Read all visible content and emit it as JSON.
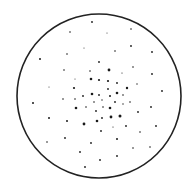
{
  "figure": {
    "width": 186,
    "height": 180,
    "background": "#ffffff",
    "circle": {
      "cx": 99,
      "cy": 96,
      "r": 82,
      "stroke": "#222222",
      "stroke_width": 1.6
    },
    "spot_color": "#1a1a1a",
    "spots": [
      {
        "x": 92,
        "y": 22,
        "r": 0.9
      },
      {
        "x": 70,
        "y": 32,
        "r": 0.8
      },
      {
        "x": 107,
        "y": 33,
        "r": 0.5
      },
      {
        "x": 131,
        "y": 29,
        "r": 0.8
      },
      {
        "x": 40,
        "y": 59,
        "r": 1.0
      },
      {
        "x": 67,
        "y": 54,
        "r": 0.8
      },
      {
        "x": 84,
        "y": 48,
        "r": 0.5
      },
      {
        "x": 115,
        "y": 51,
        "r": 0.8
      },
      {
        "x": 131,
        "y": 46,
        "r": 0.9
      },
      {
        "x": 152,
        "y": 52,
        "r": 0.9
      },
      {
        "x": 99,
        "y": 62,
        "r": 0.9
      },
      {
        "x": 64,
        "y": 70,
        "r": 0.8
      },
      {
        "x": 90,
        "y": 71,
        "r": 0.8
      },
      {
        "x": 109,
        "y": 70,
        "r": 1.4
      },
      {
        "x": 122,
        "y": 73,
        "r": 0.6
      },
      {
        "x": 133,
        "y": 67,
        "r": 0.8
      },
      {
        "x": 152,
        "y": 74,
        "r": 0.9
      },
      {
        "x": 75,
        "y": 79,
        "r": 0.5
      },
      {
        "x": 91,
        "y": 79,
        "r": 1.3
      },
      {
        "x": 99,
        "y": 80,
        "r": 1.1
      },
      {
        "x": 108,
        "y": 81,
        "r": 1.1
      },
      {
        "x": 117,
        "y": 83,
        "r": 0.9
      },
      {
        "x": 74,
        "y": 88,
        "r": 1.1
      },
      {
        "x": 49,
        "y": 87,
        "r": 0.5
      },
      {
        "x": 127,
        "y": 88,
        "r": 1.2
      },
      {
        "x": 137,
        "y": 84,
        "r": 0.7
      },
      {
        "x": 162,
        "y": 91,
        "r": 0.9
      },
      {
        "x": 83,
        "y": 96,
        "r": 0.9
      },
      {
        "x": 92,
        "y": 94,
        "r": 1.3
      },
      {
        "x": 99,
        "y": 95,
        "r": 0.9
      },
      {
        "x": 108,
        "y": 89,
        "r": 0.9
      },
      {
        "x": 117,
        "y": 93,
        "r": 1.3
      },
      {
        "x": 123,
        "y": 95,
        "r": 0.8
      },
      {
        "x": 63,
        "y": 99,
        "r": 0.8
      },
      {
        "x": 75,
        "y": 99,
        "r": 0.8
      },
      {
        "x": 33,
        "y": 103,
        "r": 1.0
      },
      {
        "x": 94,
        "y": 102,
        "r": 0.8
      },
      {
        "x": 102,
        "y": 100,
        "r": 0.7
      },
      {
        "x": 110,
        "y": 96,
        "r": 1.0
      },
      {
        "x": 115,
        "y": 102,
        "r": 0.9
      },
      {
        "x": 123,
        "y": 104,
        "r": 0.7
      },
      {
        "x": 130,
        "y": 102,
        "r": 0.8
      },
      {
        "x": 151,
        "y": 107,
        "r": 0.9
      },
      {
        "x": 76,
        "y": 108,
        "r": 1.3
      },
      {
        "x": 86,
        "y": 107,
        "r": 0.8
      },
      {
        "x": 96,
        "y": 111,
        "r": 0.9
      },
      {
        "x": 103,
        "y": 107,
        "r": 0.8
      },
      {
        "x": 110,
        "y": 108,
        "r": 1.3
      },
      {
        "x": 138,
        "y": 112,
        "r": 0.9
      },
      {
        "x": 49,
        "y": 118,
        "r": 1.0
      },
      {
        "x": 67,
        "y": 121,
        "r": 1.0
      },
      {
        "x": 97,
        "y": 121,
        "r": 1.3
      },
      {
        "x": 102,
        "y": 118,
        "r": 0.9
      },
      {
        "x": 111,
        "y": 117,
        "r": 1.4
      },
      {
        "x": 120,
        "y": 116,
        "r": 1.5
      },
      {
        "x": 84,
        "y": 124,
        "r": 1.4
      },
      {
        "x": 113,
        "y": 127,
        "r": 0.6
      },
      {
        "x": 126,
        "y": 126,
        "r": 0.9
      },
      {
        "x": 156,
        "y": 126,
        "r": 0.9
      },
      {
        "x": 101,
        "y": 131,
        "r": 0.9
      },
      {
        "x": 140,
        "y": 132,
        "r": 0.8
      },
      {
        "x": 65,
        "y": 138,
        "r": 0.9
      },
      {
        "x": 117,
        "y": 139,
        "r": 1.0
      },
      {
        "x": 47,
        "y": 142,
        "r": 0.8
      },
      {
        "x": 91,
        "y": 143,
        "r": 0.9
      },
      {
        "x": 150,
        "y": 147,
        "r": 0.8
      },
      {
        "x": 133,
        "y": 148,
        "r": 0.8
      },
      {
        "x": 80,
        "y": 152,
        "r": 0.9
      },
      {
        "x": 100,
        "y": 160,
        "r": 0.9
      },
      {
        "x": 117,
        "y": 156,
        "r": 0.9
      },
      {
        "x": 85,
        "y": 167,
        "r": 0.9
      }
    ]
  }
}
